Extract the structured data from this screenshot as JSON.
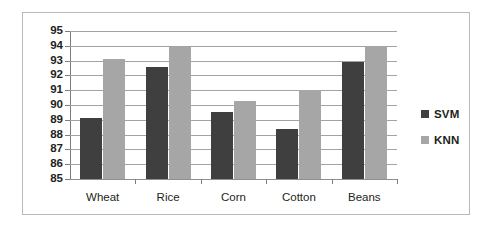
{
  "chart_data": {
    "type": "bar",
    "title": "",
    "subtitle": "",
    "xlabel": "",
    "ylabel": "",
    "categories": [
      "Wheat",
      "Rice",
      "Corn",
      "Cotton",
      "Beans"
    ],
    "series": [
      {
        "name": "SVM",
        "color": "#3f3f3f",
        "values": [
          89.1,
          92.6,
          89.5,
          88.4,
          92.9
        ]
      },
      {
        "name": "KNN",
        "color": "#a6a6a6",
        "values": [
          93.1,
          93.9,
          90.3,
          91.0,
          94.0
        ]
      }
    ],
    "ylim": [
      85,
      95
    ],
    "ytick_labels": [
      "95",
      "94",
      "93",
      "92",
      "91",
      "90",
      "89",
      "88",
      "87",
      "86",
      "85"
    ],
    "ytick_values": [
      95,
      94,
      93,
      92,
      91,
      90,
      89,
      88,
      87,
      86,
      85
    ],
    "ytick_step": 1,
    "grid": true,
    "grid_axis": "y",
    "legend": {
      "position": "right",
      "entries": [
        {
          "label": "SVM",
          "color": "#3f3f3f"
        },
        {
          "label": "KNN",
          "color": "#a6a6a6"
        }
      ]
    },
    "plot_background": "#ffffff",
    "frame_border_color": "#b9b9b9"
  }
}
